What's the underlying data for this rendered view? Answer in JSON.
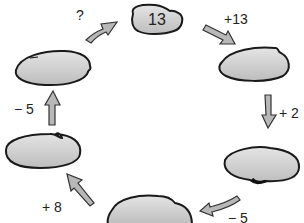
{
  "diagram": {
    "type": "cycle",
    "nodes": [
      {
        "id": "n1",
        "position": "top",
        "value": "13"
      },
      {
        "id": "n2",
        "position": "upper-right",
        "value": ""
      },
      {
        "id": "n3",
        "position": "lower-right",
        "value": ""
      },
      {
        "id": "n4",
        "position": "bottom",
        "value": ""
      },
      {
        "id": "n5",
        "position": "lower-left",
        "value": ""
      },
      {
        "id": "n6",
        "position": "upper-left",
        "value": ""
      }
    ],
    "edges": [
      {
        "from": "n1",
        "to": "n2",
        "label": "+13"
      },
      {
        "from": "n2",
        "to": "n3",
        "label": "+ 2"
      },
      {
        "from": "n3",
        "to": "n4",
        "label": "− 5"
      },
      {
        "from": "n4",
        "to": "n5",
        "label": "+ 8"
      },
      {
        "from": "n5",
        "to": "n6",
        "label": "− 5"
      },
      {
        "from": "n6",
        "to": "n1",
        "label": "?"
      }
    ]
  },
  "colors": {
    "bubble_fill": "#c8c8c8",
    "bubble_stroke": "#1a1a1a",
    "arrow_fill": "#b8b8b8",
    "text": "#222222"
  }
}
